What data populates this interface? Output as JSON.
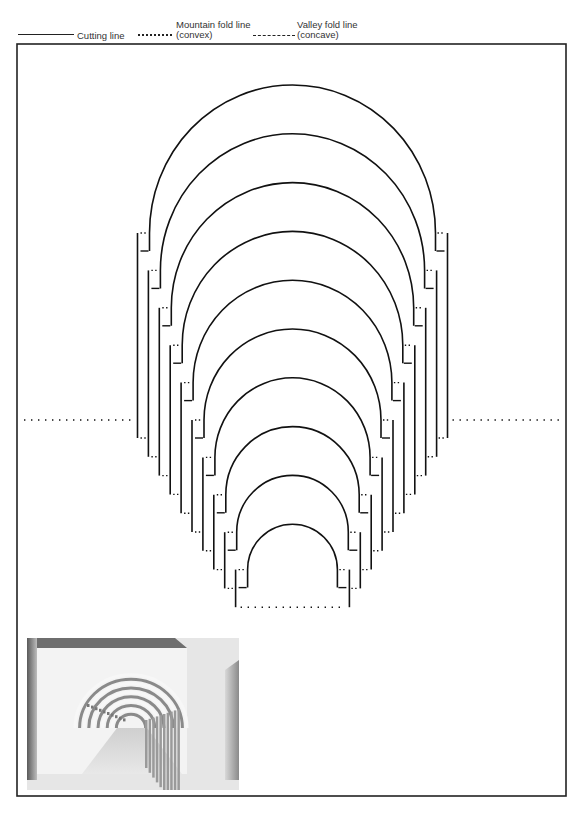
{
  "legend": {
    "cutting": {
      "label": "Cutting line",
      "style": "solid"
    },
    "mountain": {
      "label_line1": "Mountain fold line",
      "label_line2": "(convex)",
      "style": "dotted"
    },
    "valley": {
      "label_line1": "Valley fold line",
      "label_line2": "(concave)",
      "style": "dashed"
    }
  },
  "pattern": {
    "arch_count": 10,
    "center_x": 292.5,
    "outer_radius_x": 143,
    "outer_radius_y": 148,
    "radius_step_x": 10.9,
    "radius_step_y": 11.4,
    "first_arch_base_y": 233,
    "base_step_y": 37.4,
    "leg_extension": 18,
    "outer_offset": 12,
    "first_outer_bottom_y": 438,
    "outer_bottom_step_y": 18.8,
    "center_fold_y": 420
  },
  "colors": {
    "line": "#111111",
    "border": "#222222"
  },
  "photo": {
    "caption": "Pop-up tunnel of concentric arches (model photograph)"
  }
}
